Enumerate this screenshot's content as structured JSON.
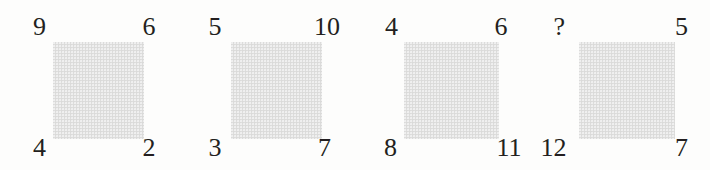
{
  "puzzle": {
    "type": "number-square-analogy",
    "background_color": "#fdfdfc",
    "square_color": "#dededd",
    "text_color": "#231f20",
    "panels": [
      {
        "index": 1,
        "top_left": "9",
        "top_right": "6",
        "bottom_left": "4",
        "bottom_right": "2"
      },
      {
        "index": 2,
        "top_left": "5",
        "top_right": "10",
        "bottom_left": "3",
        "bottom_right": "7"
      },
      {
        "index": 3,
        "top_left": "4",
        "top_right": "6",
        "bottom_left": "8",
        "bottom_right": "11"
      },
      {
        "index": 4,
        "top_left": "?",
        "top_right": "5",
        "bottom_left": "12",
        "bottom_right": "7"
      }
    ]
  }
}
